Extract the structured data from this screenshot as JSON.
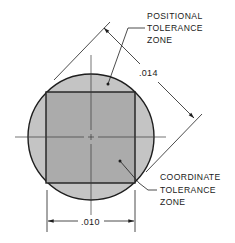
{
  "diagram": {
    "labels": {
      "positional": [
        "POSITIONAL",
        "TOLERANCE",
        "ZONE"
      ],
      "coordinate": [
        "COORDINATE",
        "TOLERANCE",
        "ZONE"
      ]
    },
    "dimensions": {
      "diagonal": ".014",
      "width": ".010"
    },
    "colors": {
      "circle_fill": "#c4c4c4",
      "square_fill": "#ababab",
      "stroke": "#1e1e1e",
      "background": "#ffffff"
    },
    "geometry": {
      "circle": {
        "cx": 91,
        "cy": 137,
        "r": 63
      },
      "square": {
        "x": 46,
        "y": 92,
        "size": 89
      }
    }
  }
}
